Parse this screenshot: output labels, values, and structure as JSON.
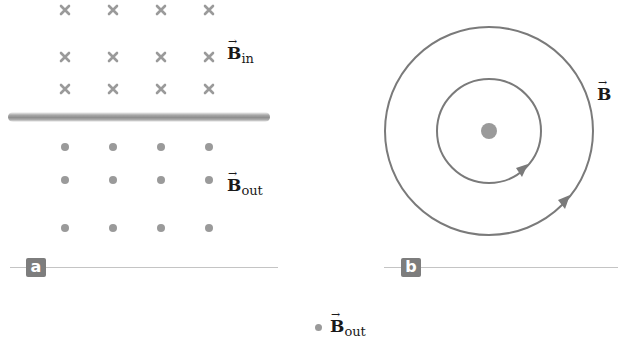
{
  "panel_a": {
    "badge": "a",
    "field_in_label": {
      "symbol": "B",
      "subscript": "in",
      "arrow": "→"
    },
    "field_out_label": {
      "symbol": "B",
      "subscript": "out",
      "arrow": "→"
    },
    "cross_rows_y": [
      10,
      57,
      89
    ],
    "dot_rows_y": [
      147,
      180,
      228
    ],
    "columns_x": [
      65,
      113,
      161,
      209
    ]
  },
  "panel_b": {
    "badge": "b",
    "field_label": {
      "symbol": "B",
      "arrow": "→"
    },
    "center": [
      489,
      131
    ],
    "circle_radii": [
      52,
      104
    ]
  },
  "legend": {
    "symbol": "B",
    "subscript": "out",
    "arrow": "→"
  },
  "colors": {
    "marker": "#9a9a9a",
    "field_line": "#7a7a7a",
    "badge_bg": "#7d7d7d",
    "label_text": "#1a1a1a"
  }
}
